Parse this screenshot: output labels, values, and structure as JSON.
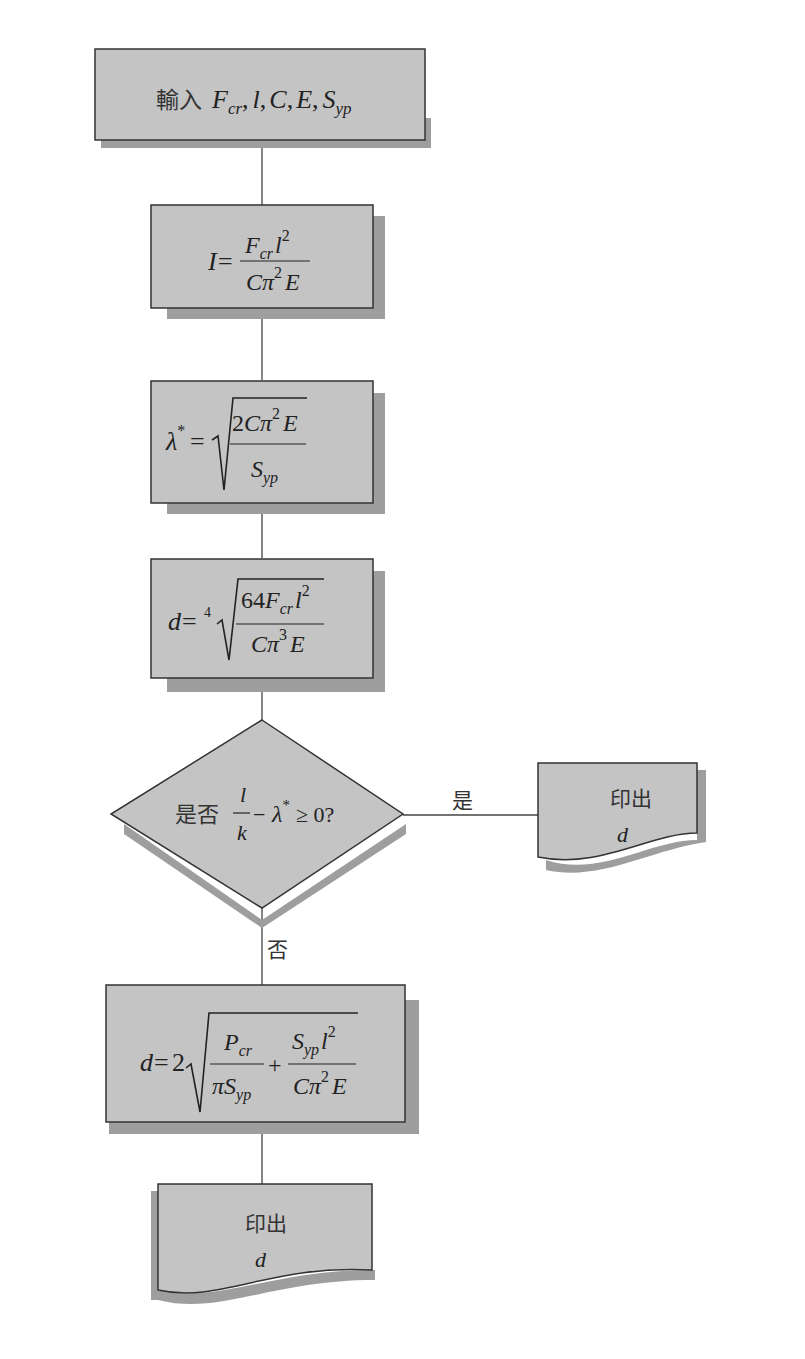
{
  "colors": {
    "box_fill": "#c4c4c4",
    "shadow": "#9e9e9e",
    "stroke": "#333333",
    "line": "#444444",
    "background": "#ffffff"
  },
  "nodes": [
    {
      "id": "input",
      "shape": "rect-wide",
      "label_cjk": "輸入",
      "label_math": "F_cr, l, C, E, S_yp"
    },
    {
      "id": "inertia",
      "shape": "rect",
      "formula": "I = F_cr l^2 / (C π^2 E)"
    },
    {
      "id": "lambda",
      "shape": "rect",
      "formula": "λ* = sqrt(2 C π^2 E / S_yp)"
    },
    {
      "id": "diameter",
      "shape": "rect",
      "formula": "d = 4th-root(64 F_cr l^2 / (C π^3 E))"
    },
    {
      "id": "decision",
      "shape": "diamond",
      "label_cjk": "是否",
      "formula": "l/k − λ* ≥ 0?"
    },
    {
      "id": "print_yes",
      "shape": "document",
      "label_cjk": "印出",
      "label_math": "d"
    },
    {
      "id": "diameter_johnson",
      "shape": "rect",
      "formula": "d = 2 sqrt(P_cr/(π S_yp) + S_yp l^2/(C π^2 E))"
    },
    {
      "id": "print_no",
      "shape": "document",
      "label_cjk": "印出",
      "label_math": "d"
    }
  ],
  "edges": [
    {
      "from": "input",
      "to": "inertia",
      "label": ""
    },
    {
      "from": "inertia",
      "to": "lambda",
      "label": ""
    },
    {
      "from": "lambda",
      "to": "diameter",
      "label": ""
    },
    {
      "from": "diameter",
      "to": "decision",
      "label": ""
    },
    {
      "from": "decision",
      "to": "print_yes",
      "label": "是"
    },
    {
      "from": "decision",
      "to": "diameter_johnson",
      "label": "否"
    },
    {
      "from": "diameter_johnson",
      "to": "print_no",
      "label": ""
    }
  ],
  "text": {
    "input_cjk": "輸入",
    "yes": "是",
    "no": "否",
    "whether": "是否",
    "print": "印出",
    "d": "d",
    "F": "F",
    "cr": "cr",
    "l": "l",
    "C": "C",
    "E": "E",
    "S": "S",
    "yp": "yp",
    "I": "I",
    "eq": "=",
    "pi": "π",
    "two": "2",
    "three": "3",
    "four": "4",
    "lambda": "λ",
    "star": "*",
    "sixtyfour": "64",
    "k": "k",
    "minus": "−",
    "geq_zero": "≥ 0?",
    "P": "P",
    "plus": "+",
    "comma": ","
  }
}
